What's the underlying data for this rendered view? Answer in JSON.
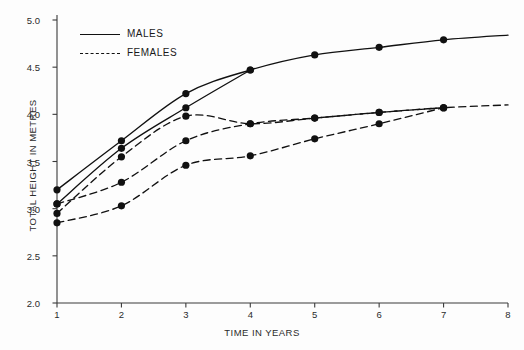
{
  "chart_data": {
    "type": "line",
    "title": "",
    "xlabel": "TIME IN YEARS",
    "ylabel": "TOTAL HEIGHT IN METRES",
    "xlim": [
      1,
      8
    ],
    "ylim": [
      2.0,
      5.0
    ],
    "xticks": [
      1,
      2,
      3,
      4,
      5,
      6,
      7,
      8
    ],
    "xtick_labels": [
      "1",
      "2",
      "3",
      "4",
      "5",
      "6",
      "7",
      "8"
    ],
    "yticks": [
      2.0,
      2.5,
      3.0,
      3.5,
      4.0,
      4.5,
      5.0
    ],
    "ytick_labels": [
      "2.0",
      "2.5",
      "3.0",
      "3.5",
      "4.0",
      "4.5",
      "5.0"
    ],
    "grid": false,
    "legend_position": "upper left",
    "marker": "filled-circle",
    "marker_color": "#111111",
    "line_color": "#111111",
    "series": [
      {
        "name": "MALES",
        "style": "solid",
        "legend_label": "MALES",
        "x": [
          1,
          2,
          3,
          4,
          5,
          6,
          7,
          8
        ],
        "values": [
          3.2,
          3.72,
          4.22,
          4.47,
          4.63,
          4.71,
          4.79,
          4.84
        ]
      },
      {
        "name": "MALES 2",
        "style": "solid",
        "legend_label": "MALES",
        "x": [
          1,
          2,
          3,
          4
        ],
        "values": [
          3.05,
          3.64,
          4.07,
          4.47
        ]
      },
      {
        "name": "FEMALES 1",
        "style": "dashed",
        "legend_label": "FEMALES",
        "x": [
          1,
          2,
          3,
          4,
          5,
          6,
          7,
          8
        ],
        "values": [
          2.95,
          3.55,
          3.98,
          3.9,
          3.96,
          4.02,
          4.07,
          4.1
        ]
      },
      {
        "name": "FEMALES 2",
        "style": "dashed",
        "legend_label": "FEMALES",
        "x": [
          1,
          2,
          3,
          4,
          5,
          6,
          7
        ],
        "values": [
          3.05,
          3.28,
          3.72,
          3.9,
          3.96,
          4.02,
          4.07
        ]
      },
      {
        "name": "FEMALES 3",
        "style": "dashed",
        "legend_label": "FEMALES",
        "x": [
          1,
          2,
          3,
          4,
          5,
          6,
          7
        ],
        "values": [
          2.85,
          3.03,
          3.46,
          3.56,
          3.74,
          3.9,
          4.07
        ]
      }
    ],
    "legend_entries": [
      {
        "label": "MALES",
        "style": "solid"
      },
      {
        "label": "FEMALES",
        "style": "dashed"
      }
    ]
  }
}
